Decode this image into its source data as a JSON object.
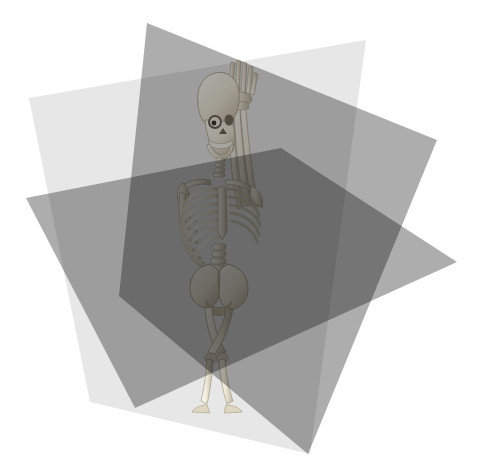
{
  "figure": {
    "background_color": "#ffffff",
    "width": 478,
    "height": 468,
    "view": "three-quarter perspective, slightly elevated camera"
  },
  "planes": [
    {
      "id": "sagittal",
      "label": "Sagittal plane",
      "alt_label": "Median / longitudinal vertical plane",
      "orientation": "vertical, divides left and right",
      "fill": "#d9d9d9",
      "opacity": 0.62,
      "points": "29,98 366,40 310,454 90,402",
      "render_order": 1
    },
    {
      "id": "coronal",
      "label": "Coronal plane",
      "alt_label": "Frontal plane",
      "orientation": "vertical, divides front and back",
      "fill": "#8d8d8d",
      "opacity": 0.72,
      "points": "147,23 437,140 308,454 119,296",
      "render_order": 2
    },
    {
      "id": "axial",
      "label": "Axial plane",
      "alt_label": "Transverse / horizontal plane",
      "orientation": "horizontal, divides superior and inferior",
      "fill": "#8a8a8a",
      "opacity": 0.7,
      "points": "26,198 281,148 457,262 135,408",
      "render_order": 3
    }
  ],
  "palette": {
    "sagittal_alone": "#d8d8d8",
    "coronal_alone": "#8e8e8e",
    "axial_alone": "#8a8a8a",
    "coronal_axial_overlap": "#7a7a7a",
    "triple_overlap": "#373737",
    "bone_light": "#f2efe4",
    "bone_mid": "#ded7c2",
    "bone_shadow": "#a89f89",
    "background": "#ffffff"
  },
  "skeleton": {
    "name": "human-skeleton",
    "pose": "standing, right arm raised overhead, legs crossed",
    "bone_color": "#eeead e",
    "parts": [
      "skull",
      "mandible",
      "cervical-spine",
      "clavicle",
      "scapula",
      "ribcage",
      "sternum",
      "humerus",
      "radius",
      "ulna",
      "hand",
      "lumbar-spine",
      "pelvis",
      "femur",
      "tibia",
      "fibula",
      "foot"
    ]
  }
}
